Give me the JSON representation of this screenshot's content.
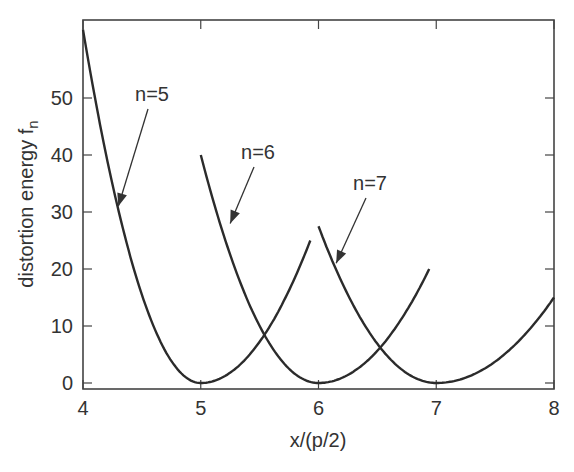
{
  "chart_data": {
    "type": "line",
    "title": "",
    "xlabel": "x/(p/2)",
    "ylabel": "distortion energy f",
    "ylabel_subscript": "n",
    "xlim": [
      4,
      8
    ],
    "ylim": [
      0,
      62
    ],
    "xticks": [
      "4",
      "5",
      "6",
      "7",
      "8"
    ],
    "yticks": [
      "0",
      "10",
      "20",
      "30",
      "40",
      "50"
    ],
    "grid": false,
    "legend": null,
    "series": [
      {
        "name": "n=5",
        "x": [
          4.0,
          4.25,
          4.5,
          4.75,
          5.0,
          5.25,
          5.5,
          5.75,
          5.93
        ],
        "y": [
          62,
          35,
          15.5,
          3.9,
          0,
          1.8,
          7.2,
          16.3,
          25
        ]
      },
      {
        "name": "n=6",
        "x": [
          5.0,
          5.25,
          5.5,
          5.75,
          6.0,
          6.25,
          6.5,
          6.75,
          6.94
        ],
        "y": [
          40,
          22.5,
          10,
          2.5,
          0,
          1.3,
          5.6,
          12.7,
          20
        ]
      },
      {
        "name": "n=7",
        "x": [
          6.0,
          6.25,
          6.5,
          6.75,
          7.0,
          7.25,
          7.5,
          7.75,
          8.0
        ],
        "y": [
          27.5,
          15.5,
          6.9,
          1.7,
          0,
          0.9,
          3.7,
          8.4,
          15
        ]
      }
    ],
    "annotations": [
      {
        "text": "n=5",
        "points_to": [
          4.3,
          31
        ]
      },
      {
        "text": "n=6",
        "points_to": [
          5.25,
          28
        ]
      },
      {
        "text": "n=7",
        "points_to": [
          6.15,
          21
        ]
      }
    ]
  }
}
